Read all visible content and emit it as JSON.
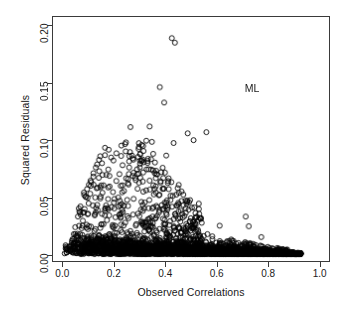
{
  "chart_data": {
    "type": "scatter",
    "title": "",
    "xlabel": "Observed Correlations",
    "ylabel": "Squared Residuals",
    "xlim": [
      -0.04,
      1.04
    ],
    "ylim": [
      -0.006,
      0.208
    ],
    "xticks": [
      "0.0",
      "0.2",
      "0.4",
      "0.6",
      "0.8",
      "1.0"
    ],
    "xtick_values": [
      0.0,
      0.2,
      0.4,
      0.6,
      0.8,
      1.0
    ],
    "yticks": [
      "0.00",
      "0.05",
      "0.10",
      "0.15",
      "0.20"
    ],
    "ytick_values": [
      0.0,
      0.05,
      0.1,
      0.15,
      0.2
    ],
    "grid": false,
    "legend": "none",
    "annotations": [
      {
        "text": "ML",
        "x": 0.74,
        "y": 0.1455
      }
    ],
    "marker": {
      "shape": "open-circle",
      "size_px": 5,
      "stroke": "#000000",
      "stroke_width": 0.9,
      "fill": "none"
    },
    "series": [
      {
        "name": "residuals",
        "description": "Dense wedge of open circles concentrated near y=0 spanning x=0 to x=0.93, with an upward plume of scatter peaking near x=0.25-0.45 and isolated high outliers near x=0.43.",
        "outliers": [
          {
            "x": 0.425,
            "y": 0.1895
          },
          {
            "x": 0.437,
            "y": 0.1855
          },
          {
            "x": 0.378,
            "y": 0.1465
          },
          {
            "x": 0.395,
            "y": 0.133
          },
          {
            "x": 0.263,
            "y": 0.1115
          },
          {
            "x": 0.338,
            "y": 0.112
          },
          {
            "x": 0.487,
            "y": 0.106
          },
          {
            "x": 0.56,
            "y": 0.107
          },
          {
            "x": 0.51,
            "y": 0.1
          },
          {
            "x": 0.432,
            "y": 0.0975
          },
          {
            "x": 0.325,
            "y": 0.0995
          },
          {
            "x": 0.347,
            "y": 0.0985
          },
          {
            "x": 0.296,
            "y": 0.094
          },
          {
            "x": 0.314,
            "y": 0.0905
          },
          {
            "x": 0.352,
            "y": 0.088
          },
          {
            "x": 0.403,
            "y": 0.0865
          },
          {
            "x": 0.272,
            "y": 0.084
          },
          {
            "x": 0.3,
            "y": 0.082
          },
          {
            "x": 0.33,
            "y": 0.08
          },
          {
            "x": 0.258,
            "y": 0.076
          },
          {
            "x": 0.289,
            "y": 0.0745
          },
          {
            "x": 0.368,
            "y": 0.07
          },
          {
            "x": 0.118,
            "y": 0.068
          },
          {
            "x": 0.246,
            "y": 0.0665
          },
          {
            "x": 0.281,
            "y": 0.067
          },
          {
            "x": 0.338,
            "y": 0.0645
          },
          {
            "x": 0.176,
            "y": 0.0585
          },
          {
            "x": 0.225,
            "y": 0.06
          },
          {
            "x": 0.082,
            "y": 0.052
          },
          {
            "x": 0.146,
            "y": 0.0505
          },
          {
            "x": 0.714,
            "y": 0.033
          },
          {
            "x": 0.726,
            "y": 0.0245
          },
          {
            "x": 0.612,
            "y": 0.025
          },
          {
            "x": 0.542,
            "y": 0.0275
          },
          {
            "x": 0.775,
            "y": 0.015
          }
        ],
        "n_points_approx": 4000
      }
    ]
  },
  "axes": {
    "ylabel": "Squared Residuals",
    "xlabel": "Observed Correlations"
  },
  "annotation": {
    "ml": "ML"
  }
}
